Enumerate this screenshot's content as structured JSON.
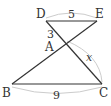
{
  "diagram": {
    "points": {
      "D": {
        "label": "D",
        "x": 46,
        "y": 21
      },
      "E": {
        "label": "E",
        "x": 97,
        "y": 21
      },
      "A": {
        "label": "A",
        "x": 66,
        "y": 43
      },
      "B": {
        "label": "B",
        "x": 12,
        "y": 84
      },
      "C": {
        "label": "C",
        "x": 102,
        "y": 84
      }
    },
    "segments": [
      [
        "D",
        "E"
      ],
      [
        "D",
        "C"
      ],
      [
        "E",
        "B"
      ],
      [
        "B",
        "C"
      ]
    ],
    "measurements": {
      "DE": "5",
      "DA": "3",
      "AC": "x",
      "BC": "9"
    },
    "colors": {
      "line": "#333333",
      "arc": "#cccccc"
    }
  }
}
